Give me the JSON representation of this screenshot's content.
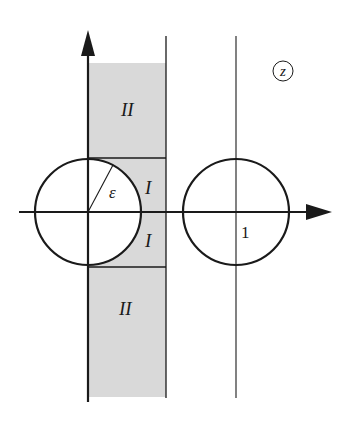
{
  "figure": {
    "plane_label": "z",
    "regions": {
      "upper_outer": "II",
      "upper_inner": "I",
      "lower_inner": "I",
      "lower_outer": "II"
    },
    "radius_label": "ε",
    "tick_label_one": "1"
  },
  "colors": {
    "ink": "#1a1a1a",
    "shade": "#d9d9d9",
    "background": "#ffffff"
  },
  "geometry": {
    "origin": [
      88,
      212
    ],
    "circle_radius": 53,
    "strip_right_x": 166,
    "unit_line_x": 236,
    "strip_top_y": 63,
    "strip_bottom_y": 397
  }
}
